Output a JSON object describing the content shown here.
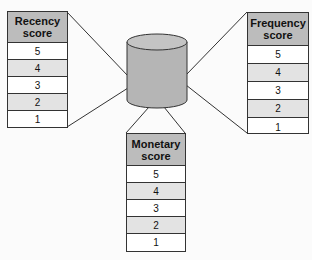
{
  "diagram": {
    "center": {
      "shape": "cylinder",
      "label": ""
    },
    "tables": [
      {
        "id": "recency",
        "title_line1": "Recency",
        "title_line2": "score",
        "rows": [
          "5",
          "4",
          "3",
          "2",
          "1"
        ]
      },
      {
        "id": "frequency",
        "title_line1": "Frequency",
        "title_line2": "score",
        "rows": [
          "5",
          "4",
          "3",
          "2",
          "1"
        ]
      },
      {
        "id": "monetary",
        "title_line1": "Monetary",
        "title_line2": "score",
        "rows": [
          "5",
          "4",
          "3",
          "2",
          "1"
        ]
      }
    ],
    "colors": {
      "header": "#bcbcbc",
      "alt_row": "#e3e3e3",
      "cylinder": "#b5b5b5",
      "line": "#333333"
    }
  }
}
